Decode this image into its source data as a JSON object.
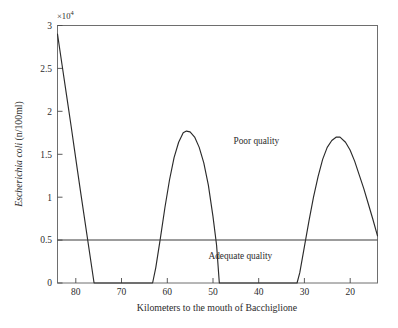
{
  "chart_data": {
    "type": "line",
    "title": "",
    "xlabel": "Kilometers to the mouth of Bacchiglione",
    "ylabel": "Escherichia coli (n/100ml)",
    "ylabel_italic_part": "Escherichia coli",
    "ylabel_plain_part": " (n/100ml)",
    "y_exponent_label": "×10",
    "y_exponent_power": "4",
    "y_exponent_full": "×10⁴",
    "y_scale_factor": 10000,
    "xlim": [
      84,
      14
    ],
    "ylim": [
      0,
      3
    ],
    "x_direction": "descending",
    "grid": false,
    "legend": false,
    "xticks": [
      80,
      70,
      60,
      50,
      40,
      30,
      20
    ],
    "xticklabels": [
      "80",
      "70",
      "60",
      "50",
      "40",
      "30",
      "20"
    ],
    "yticks": [
      0,
      0.5,
      1,
      1.5,
      2,
      2.5,
      3
    ],
    "yticklabels": [
      "0",
      "0.5",
      "1",
      "1.5",
      "2",
      "2.5",
      "3"
    ],
    "series": [
      {
        "name": "Escherichia coli concentration",
        "color": "#2b2b2b",
        "x": [
          84.0,
          83.0,
          82.0,
          81.0,
          80.3,
          79.6,
          79.0,
          76.0,
          72.0,
          68.0,
          65.0,
          63.2,
          62.5,
          61.5,
          60.5,
          59.5,
          58.5,
          57.5,
          56.5,
          55.8,
          55.0,
          54.0,
          53.0,
          52.0,
          51.0,
          50.0,
          49.2,
          48.6,
          47.0,
          44.0,
          40.0,
          36.0,
          33.0,
          31.6,
          31.0,
          30.0,
          29.0,
          28.0,
          27.0,
          26.0,
          25.0,
          24.0,
          23.0,
          22.2,
          21.0,
          20.0,
          19.0,
          18.0,
          17.0,
          16.0,
          15.0,
          14.0
        ],
        "y": [
          2.9,
          2.54,
          2.18,
          1.82,
          1.56,
          1.3,
          1.08,
          0.0,
          0.0,
          0.0,
          0.0,
          0.0,
          0.18,
          0.52,
          0.88,
          1.2,
          1.46,
          1.64,
          1.75,
          1.77,
          1.76,
          1.7,
          1.58,
          1.4,
          1.14,
          0.78,
          0.44,
          0.0,
          0.0,
          0.0,
          0.0,
          0.0,
          0.0,
          0.0,
          0.12,
          0.42,
          0.72,
          1.0,
          1.24,
          1.44,
          1.58,
          1.66,
          1.7,
          1.7,
          1.64,
          1.55,
          1.42,
          1.26,
          1.1,
          0.92,
          0.74,
          0.55
        ]
      }
    ],
    "threshold_line": {
      "name": "quality-threshold",
      "value": 0.5,
      "value_absolute": 5000,
      "orientation": "horizontal",
      "color": "#3a3a3a"
    },
    "annotations": [
      {
        "name": "poor-quality-label",
        "text": "Poor quality",
        "x": 40.5,
        "y": 1.66,
        "region": "above-threshold"
      },
      {
        "name": "adequate-quality-label",
        "text": "Adequate quality",
        "x": 44.0,
        "y": 0.32,
        "region": "below-threshold"
      }
    ]
  },
  "figure": {
    "background_color": "#ffffff",
    "frame_color": "#6e6e6e",
    "text_color": "#2b2b2b"
  }
}
